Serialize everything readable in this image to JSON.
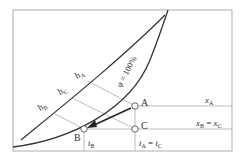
{
  "diagram": {
    "type": "psychrometric-mollier-hx",
    "curve_label": "φ = 100%",
    "points": [
      {
        "id": "A",
        "label": "A"
      },
      {
        "id": "B",
        "label": "B"
      },
      {
        "id": "C",
        "label": "C"
      }
    ],
    "enthalpy_labels": {
      "hA": {
        "main": "h",
        "sub": "A"
      },
      "hC": {
        "main": "h",
        "sub": "C"
      },
      "hB": {
        "main": "h",
        "sub": "B"
      }
    },
    "humidity_labels": {
      "xA": {
        "main": "x",
        "sub": "A"
      },
      "xBxC": {
        "left": "x",
        "leftsub": "B",
        "eq": " = ",
        "right": "x",
        "rightsub": "C"
      }
    },
    "temperature_labels": {
      "tB": {
        "main": "t",
        "sub": "B"
      },
      "tAtC": {
        "left": "t",
        "leftsub": "A",
        "eq": " = ",
        "right": "t",
        "rightsub": "C"
      }
    },
    "colors": {
      "frame": "#999999",
      "curve": "#333333",
      "thin_line": "#9a9a9a",
      "arrow": "#222222",
      "point_fill": "#ffffff"
    }
  }
}
